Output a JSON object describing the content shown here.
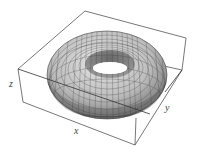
{
  "figure": {
    "type": "3d-surface",
    "axes": {
      "x_label": "x",
      "y_label": "y",
      "z_label": "z"
    },
    "box": "bounding box wireframe",
    "surface_color": "#b8b8b8",
    "mesh_color": "#3a3a3a",
    "edge_color": "#555555"
  }
}
